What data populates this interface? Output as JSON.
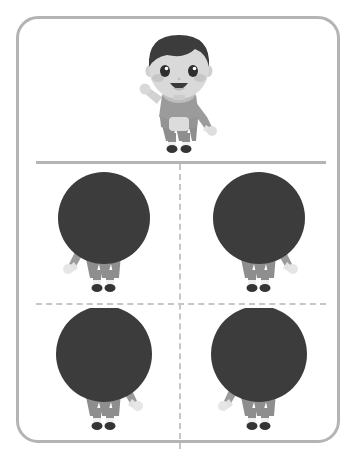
{
  "worksheet": {
    "title": "Find the matching silhouette",
    "frame": {
      "border_color": "#b4b4b4",
      "background_color": "#ffffff",
      "corner_radius": 22
    },
    "dividers": {
      "solid_horizontal_label": "solid divider between example row and answer grid",
      "dashed_color": "#c6c6c6",
      "solid_color": "#b4b4b4"
    },
    "palette": {
      "hair": "#3c3c3c",
      "skin": "#d9d9d9",
      "skin_shadow": "#c9c9c9",
      "shirt": "#9b9b9b",
      "pants": "#8e8e8e",
      "pocket": "#d9d9d9",
      "shoe": "#343434",
      "sock": "#efefef",
      "cheek": "#c2c2c2",
      "eye": "#2e2e2e",
      "mouth": "#3a3a3a",
      "cover_circle": "#3c3c3c"
    },
    "example": {
      "name": "cartoon-boy-example",
      "pose": "left arm raised waving, right arm down",
      "head_visible": true
    },
    "choices": [
      {
        "id": "choice-top-left",
        "quadrant": "top-left",
        "pose": "right arm raised, left arm down",
        "head_covered": true,
        "cover_diameter": 92
      },
      {
        "id": "choice-top-right",
        "quadrant": "top-right",
        "pose": "left arm out to side, right arm down",
        "head_covered": true,
        "cover_diameter": 92
      },
      {
        "id": "choice-bottom-left",
        "quadrant": "bottom-left",
        "pose": "left arm raised, right arm bent out",
        "head_covered": true,
        "cover_diameter": 96
      },
      {
        "id": "choice-bottom-right",
        "quadrant": "bottom-right",
        "pose": "right arm raised, left arm bent down",
        "head_covered": true,
        "cover_diameter": 96
      }
    ]
  }
}
